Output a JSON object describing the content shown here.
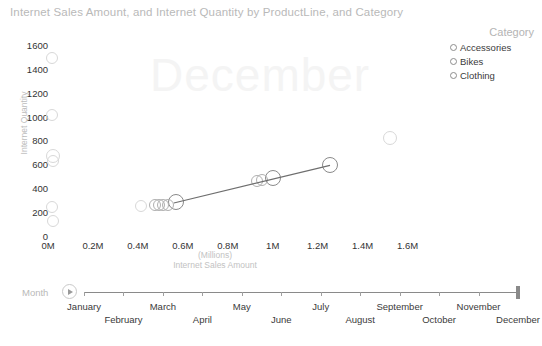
{
  "chart_data": {
    "type": "scatter",
    "title": "Internet Sales Amount, and Internet Quantity by ProductLine, and Category",
    "xlabel": "Internet Sales Amount",
    "xlabel_units": "(Millions)",
    "ylabel": "Internet Quantity",
    "xlim": [
      0,
      1700000
    ],
    "ylim": [
      0,
      1650
    ],
    "x_ticks": [
      "0M",
      "0.2M",
      "0.4M",
      "0.6M",
      "0.8M",
      "1M",
      "1.2M",
      "1.4M",
      "1.6M"
    ],
    "x_tick_values": [
      0,
      200000,
      400000,
      600000,
      800000,
      1000000,
      1200000,
      1400000,
      1600000
    ],
    "y_ticks": [
      "0",
      "200",
      "400",
      "600",
      "800",
      "1000",
      "1200",
      "1400",
      "1600"
    ],
    "y_tick_values": [
      0,
      200,
      400,
      600,
      800,
      1000,
      1200,
      1400,
      1600
    ],
    "grid": false,
    "legend_position": "top-right",
    "watermark": "December",
    "legend": {
      "title": "Category",
      "entries": [
        {
          "label": "Accessories",
          "color": "#8d8d8d"
        },
        {
          "label": "Bikes",
          "color": "#8d8d8d"
        },
        {
          "label": "Clothing",
          "color": "#8d8d8d"
        }
      ]
    },
    "trendline": {
      "x0": 560000,
      "y0": 285,
      "x1": 1255000,
      "y1": 600,
      "color": "#6e6e6e"
    },
    "series": [
      {
        "name": "Accessories",
        "color": "#d8d8d8",
        "points": [
          {
            "x": 18000,
            "y": 1500,
            "r": 6
          },
          {
            "x": 20000,
            "y": 1020,
            "r": 6
          },
          {
            "x": 22000,
            "y": 680,
            "r": 7
          },
          {
            "x": 24000,
            "y": 635,
            "r": 6
          },
          {
            "x": 20000,
            "y": 250,
            "r": 6
          },
          {
            "x": 24000,
            "y": 130,
            "r": 6
          },
          {
            "x": 412000,
            "y": 258,
            "r": 6
          },
          {
            "x": 1520000,
            "y": 830,
            "r": 7
          }
        ]
      },
      {
        "name": "Bikes",
        "color": "#8a8a8a",
        "points": [
          {
            "x": 570000,
            "y": 290,
            "r": 8
          },
          {
            "x": 1000000,
            "y": 490,
            "r": 8
          },
          {
            "x": 1255000,
            "y": 600,
            "r": 8
          }
        ]
      },
      {
        "name": "Clothing",
        "color": "#b0b0b0",
        "points": [
          {
            "x": 478000,
            "y": 268,
            "r": 6
          },
          {
            "x": 496000,
            "y": 268,
            "r": 6
          },
          {
            "x": 512000,
            "y": 270,
            "r": 6
          },
          {
            "x": 534000,
            "y": 272,
            "r": 6
          },
          {
            "x": 930000,
            "y": 470,
            "r": 6
          },
          {
            "x": 952000,
            "y": 476,
            "r": 6
          }
        ]
      }
    ]
  },
  "slider": {
    "label": "Month",
    "play_label": "play-button",
    "months": [
      "January",
      "February",
      "March",
      "April",
      "May",
      "June",
      "July",
      "August",
      "September",
      "October",
      "November",
      "December"
    ],
    "selected": "December",
    "handle_position_pct": 100
  },
  "footer": {
    "cut_off_text": ""
  }
}
